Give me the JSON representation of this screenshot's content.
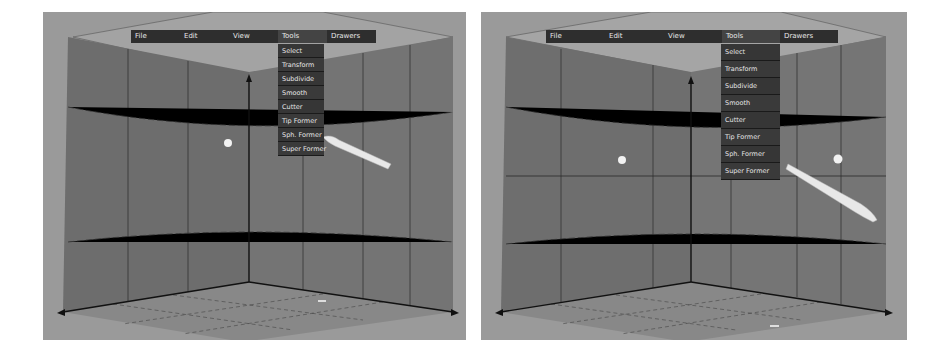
{
  "panels": [
    {
      "id": "left",
      "menubar": {
        "items": [
          {
            "label": "File"
          },
          {
            "label": "Edit"
          },
          {
            "label": "View"
          },
          {
            "label": "Tools"
          },
          {
            "label": "Drawers"
          }
        ],
        "open_menu": "Tools"
      },
      "dropdown": {
        "items": [
          {
            "label": "Select"
          },
          {
            "label": "Transform"
          },
          {
            "label": "Subdivide"
          },
          {
            "label": "Smooth"
          },
          {
            "label": "Cutter"
          },
          {
            "label": "Tip Former"
          },
          {
            "label": "Sph. Former"
          },
          {
            "label": "Super Former"
          }
        ]
      }
    },
    {
      "id": "right",
      "menubar": {
        "items": [
          {
            "label": "File"
          },
          {
            "label": "Edit"
          },
          {
            "label": "View"
          },
          {
            "label": "Tools"
          },
          {
            "label": "Drawers"
          }
        ],
        "open_menu": "Tools"
      },
      "dropdown": {
        "items": [
          {
            "label": "Select"
          },
          {
            "label": "Transform"
          },
          {
            "label": "Subdivide"
          },
          {
            "label": "Smooth"
          },
          {
            "label": "Cutter"
          },
          {
            "label": "Tip Former"
          },
          {
            "label": "Sph. Former"
          },
          {
            "label": "Super Former"
          }
        ]
      }
    }
  ],
  "colors": {
    "viewport_bg": "#9a9a9a",
    "wall": "#6f6f6f",
    "menu_bg": "#2e2e2e",
    "menu_text": "#e8e8e8"
  }
}
